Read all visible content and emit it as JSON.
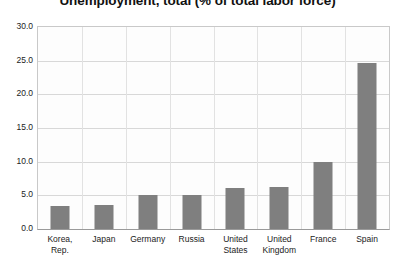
{
  "chart_data": {
    "type": "bar",
    "title": "Unemployment, total (% of total labor force)",
    "xlabel": "",
    "ylabel": "",
    "categories": [
      "Korea, Rep.",
      "Japan",
      "Germany",
      "Russia",
      "United States",
      "United Kingdom",
      "France",
      "Spain"
    ],
    "values": [
      3.4,
      3.6,
      5.0,
      5.0,
      6.1,
      6.2,
      9.9,
      24.7
    ],
    "ylim": [
      0.0,
      30.0
    ],
    "ytick_values": [
      0.0,
      5.0,
      10.0,
      15.0,
      20.0,
      25.0,
      30.0
    ],
    "ytick_labels": [
      "0.0",
      "5.0",
      "10.0",
      "15.0",
      "20.0",
      "25.0",
      "30.0"
    ],
    "grid": true,
    "legend": false,
    "legend_position": "none",
    "bar_color": "#7f7f7f",
    "gridline_color": "#d8d8d8",
    "plot_border_color": "#c9c9c9",
    "background_color": "#ffffff"
  }
}
